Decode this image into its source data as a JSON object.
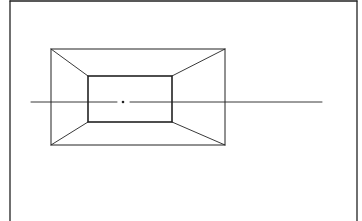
{
  "diagram": {
    "title": "",
    "stroke_color": "#222222",
    "background": "#ffffff",
    "frame": {
      "x1": 10,
      "y1": 1,
      "x2": 357,
      "y2": 221
    },
    "outer_rect": {
      "x": 51,
      "y": 49,
      "w": 174,
      "h": 96
    },
    "inner_rect": {
      "x": 88,
      "y": 76,
      "w": 84,
      "h": 46
    },
    "horizon_line": {
      "y": 102,
      "x1": 31,
      "x2": 322
    },
    "vanishing_point": {
      "x": 123,
      "y": 102
    }
  }
}
